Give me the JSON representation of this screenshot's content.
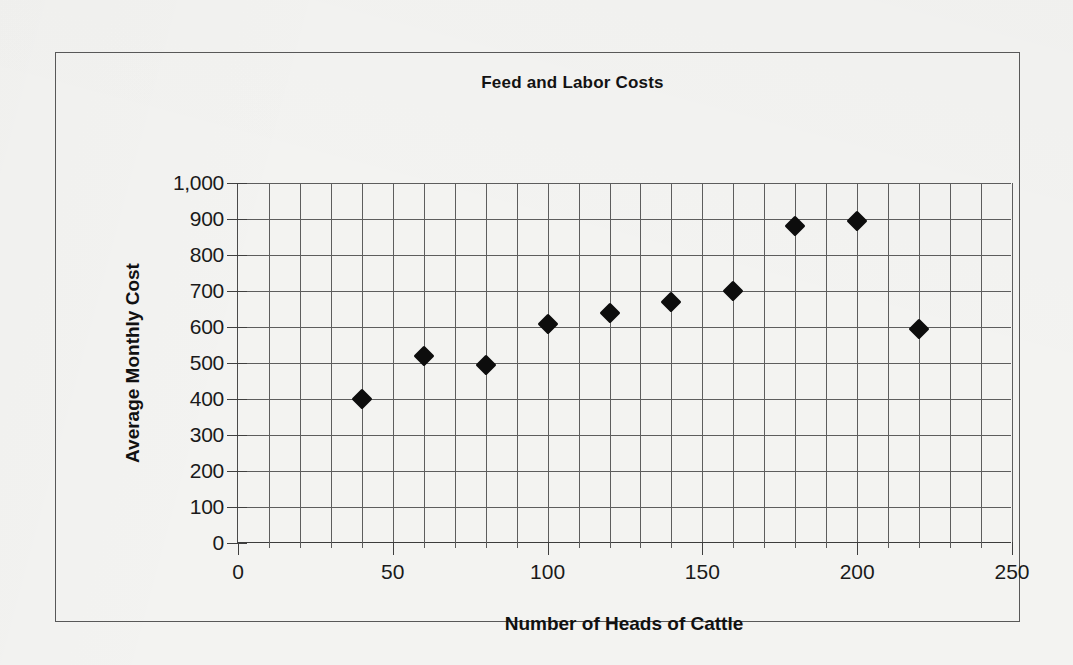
{
  "chart_data": {
    "type": "scatter",
    "title": "Feed and Labor Costs",
    "xlabel": "Number of Heads of Cattle",
    "ylabel": "Average Monthly Cost",
    "xlim": [
      0,
      250
    ],
    "ylim": [
      0,
      1000
    ],
    "x_major_step": 50,
    "x_minor_step": 10,
    "y_major_step": 100,
    "grid": true,
    "legend": false,
    "marker": "diamond",
    "marker_color": "#0d0d0d",
    "x_ticks": [
      "0",
      "50",
      "100",
      "150",
      "200",
      "250"
    ],
    "y_ticks": [
      "0",
      "100",
      "200",
      "300",
      "400",
      "500",
      "600",
      "700",
      "800",
      "900",
      "1,000"
    ],
    "x": [
      40,
      60,
      80,
      100,
      120,
      140,
      160,
      180,
      200,
      220
    ],
    "y": [
      400,
      520,
      495,
      608,
      640,
      670,
      700,
      880,
      895,
      595
    ],
    "points": [
      {
        "x": 40,
        "y": 400
      },
      {
        "x": 60,
        "y": 520
      },
      {
        "x": 80,
        "y": 495
      },
      {
        "x": 100,
        "y": 608
      },
      {
        "x": 120,
        "y": 640
      },
      {
        "x": 140,
        "y": 670
      },
      {
        "x": 160,
        "y": 700
      },
      {
        "x": 180,
        "y": 880
      },
      {
        "x": 200,
        "y": 895
      },
      {
        "x": 220,
        "y": 595
      }
    ]
  }
}
